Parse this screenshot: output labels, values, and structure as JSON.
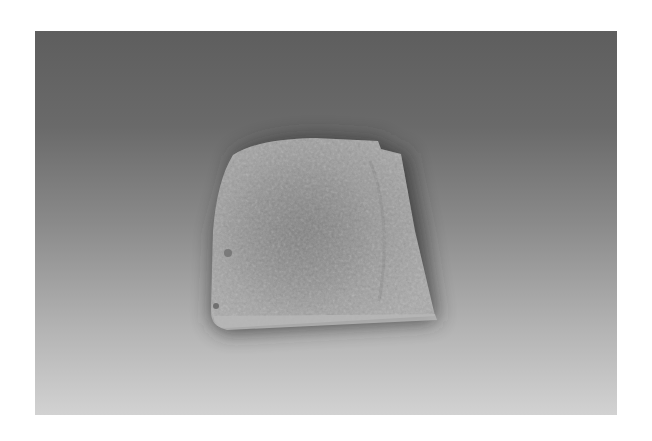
{
  "image": {
    "subject": "stone-artifact",
    "description": "Weathered flat stone tablet with rounded top-left corner and a notched top-right corner, photographed on a grey gradient backdrop",
    "colors": {
      "background_top": "#5e5e5e",
      "background_bottom": "#d2d2d2",
      "stone_light": "#a8a8a8",
      "stone_mid": "#8e8e8e",
      "stone_dark": "#6f6f6f",
      "shadow": "#2a2a2a"
    }
  }
}
